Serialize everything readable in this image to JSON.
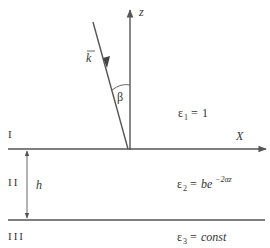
{
  "diagram": {
    "axes": {
      "z_label": "z",
      "x_label": "X"
    },
    "wave_vector_label": "k",
    "angle_label": "β",
    "regions": [
      {
        "roman": "I",
        "eps_symbol": "ε",
        "eps_index": "1",
        "eps_rhs": "1"
      },
      {
        "roman": "II",
        "eps_symbol": "ε",
        "eps_index": "2",
        "eps_rhs_base": "be",
        "eps_rhs_exp": "−2αz"
      },
      {
        "roman": "III",
        "eps_symbol": "ε",
        "eps_index": "3",
        "eps_rhs": "const"
      }
    ],
    "thickness_label": "h"
  }
}
